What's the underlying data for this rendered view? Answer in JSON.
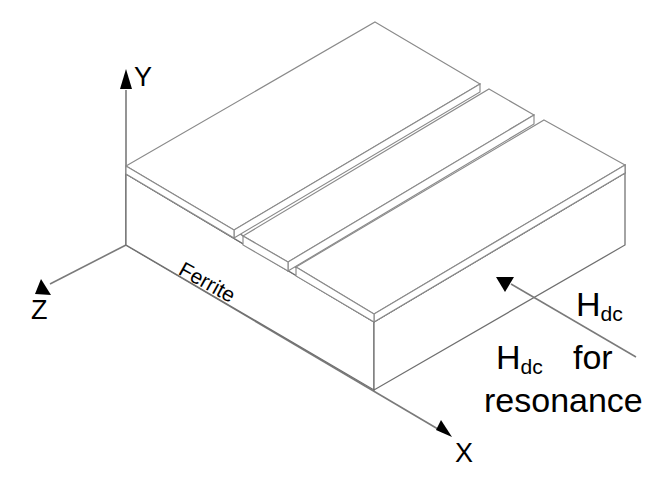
{
  "figure": {
    "type": "technical-line-diagram",
    "background_color": "#ffffff",
    "line_color": "#6f6f6f",
    "text_color": "#000000"
  },
  "axes": {
    "y_label": "Y",
    "z_label": "Z",
    "x_label": "X",
    "origin_px": [
      126,
      245
    ]
  },
  "labels": {
    "material": "Ferrite",
    "field_symbol_h": "H",
    "field_symbol_sub": "dc",
    "field_note_for": "for",
    "field_note_resonance": "resonance"
  },
  "annotations": [
    {
      "name": "hdc-direction-arrow",
      "shape": "down-triangle",
      "tip_px": [
        505,
        291
      ],
      "leader_from_px": [
        511,
        284
      ],
      "leader_to_px": [
        636,
        357
      ]
    }
  ],
  "structure": {
    "slab_name": "Ferrite",
    "strip_count": 3,
    "projection": "isometric"
  }
}
